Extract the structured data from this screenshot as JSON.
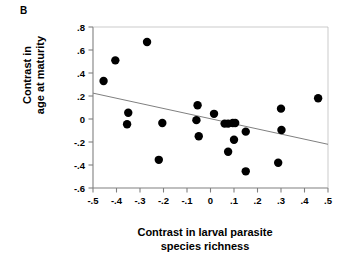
{
  "figure": {
    "panel_letter": "B",
    "xlabel_line1": "Contrast in larval parasite",
    "xlabel_line2": "species richness",
    "ylabel_line1": "Contrast in",
    "ylabel_line2": "age at maturity"
  },
  "colors": {
    "point": "#000000",
    "axis": "#808080",
    "trendline": "#808080",
    "background": "#ffffff",
    "text": "#000000"
  },
  "chart_data": {
    "type": "scatter",
    "title": "",
    "panel": "B",
    "xlabel": "Contrast in larval parasite species richness",
    "ylabel": "Contrast in age at maturity",
    "xlim": [
      -0.5,
      0.5
    ],
    "ylim": [
      -0.6,
      0.8
    ],
    "xticks": [
      -0.5,
      -0.4,
      -0.3,
      -0.2,
      -0.1,
      0,
      0.1,
      0.2,
      0.3,
      0.4,
      0.5
    ],
    "xtick_labels": [
      "-.5",
      "-.4",
      "-.3",
      "-.2",
      "-.1",
      "0",
      ".1",
      ".2",
      ".3",
      ".4",
      ".5"
    ],
    "yticks": [
      -0.6,
      -0.4,
      -0.2,
      0,
      0.2,
      0.4,
      0.6,
      0.8
    ],
    "ytick_labels": [
      "-.6",
      "-.4",
      "-.2",
      "0",
      ".2",
      ".4",
      ".6",
      ".8"
    ],
    "grid": false,
    "legend": false,
    "points": [
      {
        "x": -0.455,
        "y": 0.33
      },
      {
        "x": -0.405,
        "y": 0.51
      },
      {
        "x": -0.27,
        "y": 0.67
      },
      {
        "x": -0.35,
        "y": 0.055
      },
      {
        "x": -0.355,
        "y": -0.045
      },
      {
        "x": -0.205,
        "y": -0.035
      },
      {
        "x": -0.22,
        "y": -0.355
      },
      {
        "x": -0.055,
        "y": 0.12
      },
      {
        "x": -0.06,
        "y": -0.01
      },
      {
        "x": -0.05,
        "y": -0.15
      },
      {
        "x": 0.015,
        "y": 0.045
      },
      {
        "x": 0.06,
        "y": -0.04
      },
      {
        "x": 0.075,
        "y": -0.04
      },
      {
        "x": 0.095,
        "y": -0.035
      },
      {
        "x": 0.105,
        "y": -0.035
      },
      {
        "x": 0.1,
        "y": -0.18
      },
      {
        "x": 0.075,
        "y": -0.285
      },
      {
        "x": 0.15,
        "y": -0.11
      },
      {
        "x": 0.15,
        "y": -0.455
      },
      {
        "x": 0.288,
        "y": -0.38
      },
      {
        "x": 0.302,
        "y": -0.095
      },
      {
        "x": 0.3,
        "y": 0.09
      },
      {
        "x": 0.458,
        "y": 0.18
      }
    ],
    "trendline": {
      "x0": -0.5,
      "y0": 0.225,
      "x1": 0.5,
      "y1": -0.22
    }
  }
}
